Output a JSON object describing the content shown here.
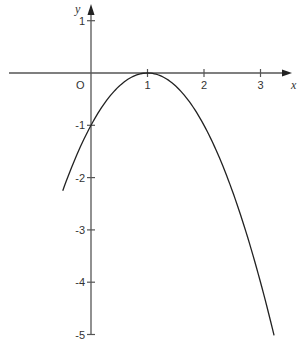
{
  "chart_data": {
    "type": "line",
    "title": "",
    "xlabel": "x",
    "ylabel": "y",
    "origin_label": "O",
    "function": "y = -(x - 1)^2",
    "x_ticks": [
      1,
      2,
      3
    ],
    "x_tick_labels": [
      "1",
      "2",
      "3"
    ],
    "y_ticks": [
      1,
      -1,
      -2,
      -3,
      -4,
      -5
    ],
    "y_tick_labels": [
      "1",
      "-1",
      "-2",
      "-3",
      "-4",
      "-5"
    ],
    "xlim": [
      -1.5,
      3.6
    ],
    "ylim": [
      -5.2,
      1.3
    ],
    "grid": false,
    "legend": null,
    "series": [
      {
        "name": "curve",
        "x": [
          -0.5,
          -0.25,
          0,
          0.25,
          0.5,
          0.75,
          1,
          1.25,
          1.5,
          1.75,
          2,
          2.25,
          2.5,
          2.75,
          3,
          3.24
        ],
        "y": [
          -2.25,
          -1.5625,
          -1,
          -0.5625,
          -0.25,
          -0.0625,
          0,
          -0.0625,
          -0.25,
          -0.5625,
          -1,
          -1.5625,
          -2.25,
          -3.0625,
          -4,
          -5.02
        ]
      }
    ],
    "annotations": [
      {
        "text": "vertex at (1, 0)",
        "x": 1,
        "y": 0
      },
      {
        "text": "y-intercept at (0, -1)",
        "x": 0,
        "y": -1
      }
    ]
  }
}
